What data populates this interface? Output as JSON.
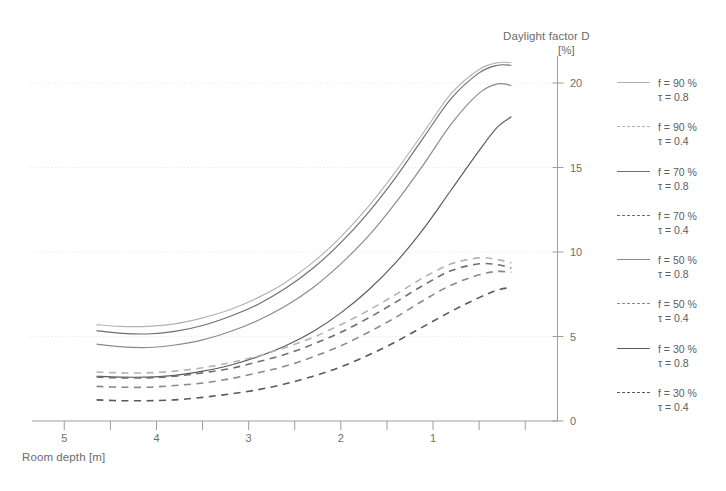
{
  "figure": {
    "y_axis_title_line1": "Daylight factor D",
    "y_axis_title_line2": "[%]",
    "x_axis_title": "Room depth [m]"
  },
  "legend": {
    "items": [
      {
        "name": "f-90-tau-08",
        "line1": "f = 90 %",
        "line2": "τ = 0.8",
        "style": "solid",
        "color": "#b3b3b3"
      },
      {
        "name": "f-90-tau-04",
        "line1": "f = 90 %",
        "line2": "τ = 0.4",
        "style": "dashed",
        "color": "#b3b3b3"
      },
      {
        "name": "f-70-tau-08",
        "line1": "f = 70 %",
        "line2": "τ = 0.8",
        "style": "solid",
        "color": "#6f6f6f"
      },
      {
        "name": "f-70-tau-04",
        "line1": "f = 70 %",
        "line2": "τ = 0.4",
        "style": "dashed",
        "color": "#6f6f6f"
      },
      {
        "name": "f-50-tau-08",
        "line1": "f = 50 %",
        "line2": "τ = 0.8",
        "style": "solid",
        "color": "#8a8a8a"
      },
      {
        "name": "f-50-tau-04",
        "line1": "f = 50 %",
        "line2": "τ = 0.4",
        "style": "dashed",
        "color": "#8a8a8a"
      },
      {
        "name": "f-30-tau-08",
        "line1": "f = 30 %",
        "line2": "τ = 0.8",
        "style": "solid",
        "color": "#5a5a5a"
      },
      {
        "name": "f-30-tau-04",
        "line1": "f = 30 %",
        "line2": "τ = 0.4",
        "style": "dashed",
        "color": "#5a5a5a"
      }
    ]
  },
  "chart_data": {
    "type": "line",
    "title": "Daylight factor D [%]",
    "xlabel": "Room depth [m]",
    "ylabel": "Daylight factor D [%]",
    "xlim": [
      5.35,
      -0.35
    ],
    "ylim": [
      0,
      21.5
    ],
    "x_axis_reversed": true,
    "xticks": [
      5,
      4,
      3,
      2,
      1
    ],
    "xticks_minor": [
      4.5,
      3.5,
      2.5,
      1.5,
      0.5,
      0
    ],
    "yticks": [
      0,
      5,
      10,
      15,
      20
    ],
    "grid": "horizontal-dotted-faint",
    "legend_position": "right-outside",
    "x": [
      4.65,
      4.4,
      4.1,
      3.8,
      3.5,
      3.2,
      2.9,
      2.6,
      2.3,
      2.0,
      1.7,
      1.4,
      1.1,
      0.8,
      0.5,
      0.3,
      0.15
    ],
    "series": [
      {
        "name": "f = 90 %, τ = 0.8",
        "f": 90,
        "tau": 0.8,
        "style": "solid",
        "color": "#b3b3b3",
        "values": [
          5.7,
          5.6,
          5.6,
          5.75,
          6.1,
          6.6,
          7.3,
          8.2,
          9.4,
          10.9,
          12.7,
          14.8,
          17.1,
          19.4,
          20.8,
          21.2,
          21.2
        ]
      },
      {
        "name": "f = 70 %, τ = 0.8",
        "f": 70,
        "tau": 0.8,
        "style": "solid",
        "color": "#6f6f6f",
        "values": [
          5.35,
          5.2,
          5.15,
          5.3,
          5.65,
          6.2,
          6.9,
          7.85,
          9.05,
          10.55,
          12.35,
          14.45,
          16.8,
          19.1,
          20.6,
          21.05,
          21.05
        ]
      },
      {
        "name": "f = 50 %, τ = 0.8",
        "f": 50,
        "tau": 0.8,
        "style": "solid",
        "color": "#8a8a8a",
        "values": [
          4.55,
          4.4,
          4.35,
          4.5,
          4.8,
          5.3,
          5.95,
          6.8,
          7.9,
          9.3,
          10.95,
          12.95,
          15.2,
          17.6,
          19.4,
          19.95,
          19.85
        ]
      },
      {
        "name": "f = 30 %, τ = 0.8",
        "f": 30,
        "tau": 0.8,
        "style": "solid",
        "color": "#5a5a5a",
        "values": [
          2.65,
          2.6,
          2.6,
          2.7,
          2.95,
          3.3,
          3.8,
          4.45,
          5.3,
          6.4,
          7.75,
          9.4,
          11.4,
          13.7,
          16.0,
          17.4,
          18.0
        ]
      },
      {
        "name": "f = 90 %, τ = 0.4",
        "f": 90,
        "tau": 0.4,
        "style": "dashed",
        "color": "#b3b3b3",
        "values": [
          2.9,
          2.85,
          2.85,
          2.95,
          3.15,
          3.45,
          3.85,
          4.35,
          4.95,
          5.7,
          6.55,
          7.5,
          8.5,
          9.3,
          9.65,
          9.55,
          9.35
        ]
      },
      {
        "name": "f = 70 %, τ = 0.4",
        "f": 70,
        "tau": 0.4,
        "style": "dashed",
        "color": "#6f6f6f",
        "values": [
          2.6,
          2.55,
          2.55,
          2.65,
          2.85,
          3.1,
          3.5,
          3.95,
          4.55,
          5.25,
          6.1,
          7.05,
          8.05,
          8.9,
          9.3,
          9.25,
          9.05
        ]
      },
      {
        "name": "f = 50 %, τ = 0.4",
        "f": 50,
        "tau": 0.4,
        "style": "dashed",
        "color": "#8a8a8a",
        "values": [
          2.05,
          2.0,
          2.0,
          2.1,
          2.25,
          2.5,
          2.85,
          3.25,
          3.8,
          4.45,
          5.25,
          6.15,
          7.15,
          8.05,
          8.65,
          8.85,
          8.8
        ]
      },
      {
        "name": "f = 30 %, τ = 0.4",
        "f": 30,
        "tau": 0.4,
        "style": "dashed",
        "color": "#5a5a5a",
        "values": [
          1.25,
          1.2,
          1.2,
          1.25,
          1.4,
          1.6,
          1.85,
          2.2,
          2.65,
          3.2,
          3.9,
          4.7,
          5.6,
          6.5,
          7.3,
          7.75,
          7.9
        ]
      }
    ]
  }
}
